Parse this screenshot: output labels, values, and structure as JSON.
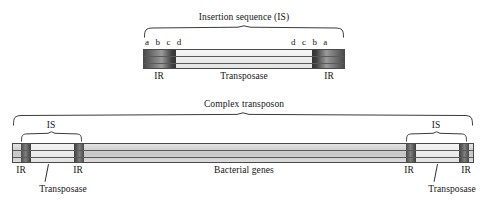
{
  "figure": {
    "title_top": "Insertion sequence (IS)",
    "title_bottom": "Complex transposon"
  },
  "insertion_sequence": {
    "bracket_label": "Insertion sequence (IS)",
    "left_repeat_bases": "a b c d",
    "right_repeat_bases": "d c b a",
    "left_ir_label": "IR",
    "right_ir_label": "IR",
    "gene_label": "Transposase"
  },
  "complex_transposon": {
    "bracket_label": "Complex transposon",
    "center_label": "Bacterial genes",
    "left_is": {
      "bracket_label": "IS",
      "left_ir_label": "IR",
      "right_ir_label": "IR",
      "gene_label": "Transposase"
    },
    "right_is": {
      "bracket_label": "IS",
      "left_ir_label": "IR",
      "right_ir_label": "IR",
      "gene_label": "Transposase"
    }
  },
  "colors": {
    "outline": "#4a4a4a",
    "ir_dark": "#3a3a3a",
    "ir_light": "#d9d9d9",
    "body_light": "#efefef",
    "genes_mid": "#c9c9c9",
    "text": "#141414",
    "background": "#ffffff"
  }
}
